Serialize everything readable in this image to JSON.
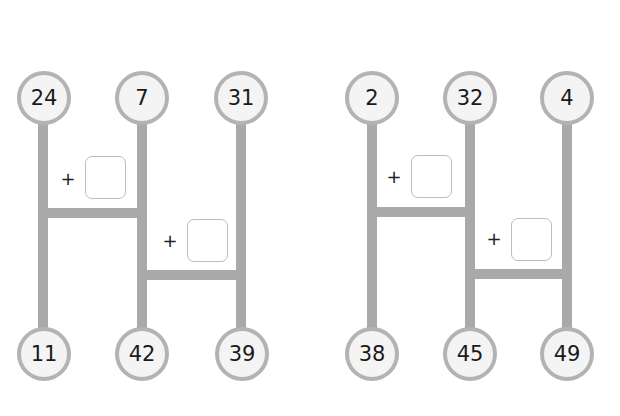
{
  "colors": {
    "line": "#a9a9a9",
    "node_fill": "#f4f4f4",
    "node_border": "#b3b3b3",
    "box_border": "#bdbdbd"
  },
  "operator": "+",
  "puzzles": [
    {
      "top": [
        "24",
        "7",
        "31"
      ],
      "bottom": [
        "11",
        "42",
        "39"
      ]
    },
    {
      "top": [
        "2",
        "32",
        "4"
      ],
      "bottom": [
        "38",
        "45",
        "49"
      ]
    }
  ]
}
